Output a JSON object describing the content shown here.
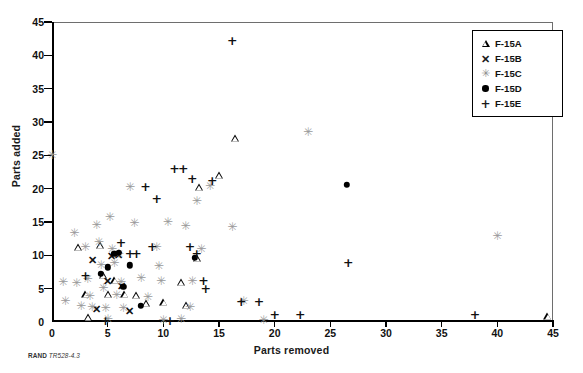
{
  "caption": {
    "bold": "RAND",
    "italic": "TR528-4.3"
  },
  "legend": {
    "position": "top-right",
    "entries": [
      {
        "label": "F-15A",
        "marker": "triangle"
      },
      {
        "label": "F-15B",
        "marker": "x"
      },
      {
        "label": "F-15C",
        "marker": "asterisk"
      },
      {
        "label": "F-15D",
        "marker": "filled-circle"
      },
      {
        "label": "F-15E",
        "marker": "plus"
      }
    ]
  },
  "chart_data": {
    "type": "scatter",
    "title": "",
    "xlabel": "Parts removed",
    "ylabel": "Parts added",
    "xlim": [
      0,
      45
    ],
    "ylim": [
      0,
      45
    ],
    "xticks": [
      0,
      5,
      10,
      15,
      20,
      25,
      30,
      35,
      40,
      45
    ],
    "yticks": [
      0,
      5,
      10,
      15,
      20,
      25,
      30,
      35,
      40,
      45
    ],
    "grid": false,
    "series": [
      {
        "name": "F-15A",
        "marker": "triangle",
        "color": "#000000",
        "points": [
          [
            2.3,
            11.3
          ],
          [
            3.0,
            4.2
          ],
          [
            3.2,
            0.8
          ],
          [
            4.3,
            11.6
          ],
          [
            4.6,
            7.1
          ],
          [
            5.0,
            4.2
          ],
          [
            5.6,
            6.3
          ],
          [
            6.5,
            4.2
          ],
          [
            7.5,
            4.1
          ],
          [
            8.4,
            2.9
          ],
          [
            10.0,
            3.0
          ],
          [
            11.6,
            6.0
          ],
          [
            12.0,
            2.6
          ],
          [
            13.0,
            9.6
          ],
          [
            13.2,
            20.2
          ],
          [
            15.0,
            22.0
          ],
          [
            16.4,
            27.6
          ],
          [
            44.5,
            0.9
          ]
        ]
      },
      {
        "name": "F-15B",
        "marker": "x",
        "color": "#111111",
        "points": [
          [
            3.6,
            9.3
          ],
          [
            4.0,
            2.0
          ],
          [
            5.0,
            6.2
          ],
          [
            5.3,
            9.9
          ],
          [
            6.0,
            10.1
          ],
          [
            6.2,
            5.4
          ],
          [
            7.0,
            1.6
          ]
        ]
      },
      {
        "name": "F-15C",
        "marker": "asterisk",
        "color": "#9a9a9a",
        "points": [
          [
            0.0,
            25.0
          ],
          [
            1.0,
            6.0
          ],
          [
            1.2,
            3.1
          ],
          [
            2.0,
            13.4
          ],
          [
            2.2,
            5.9
          ],
          [
            2.6,
            2.4
          ],
          [
            3.0,
            11.3
          ],
          [
            3.2,
            6.4
          ],
          [
            3.4,
            3.9
          ],
          [
            3.6,
            2.2
          ],
          [
            4.0,
            14.6
          ],
          [
            4.2,
            12.0
          ],
          [
            4.4,
            8.6
          ],
          [
            4.6,
            5.1
          ],
          [
            4.8,
            2.1
          ],
          [
            5.0,
            0.4
          ],
          [
            5.2,
            15.8
          ],
          [
            5.4,
            11.0
          ],
          [
            5.6,
            8.8
          ],
          [
            5.8,
            4.0
          ],
          [
            6.0,
            10.2
          ],
          [
            6.2,
            6.0
          ],
          [
            6.4,
            2.1
          ],
          [
            7.0,
            20.2
          ],
          [
            7.4,
            14.9
          ],
          [
            8.0,
            6.6
          ],
          [
            8.6,
            3.8
          ],
          [
            9.4,
            11.3
          ],
          [
            9.6,
            8.4
          ],
          [
            9.8,
            6.1
          ],
          [
            10.0,
            0.3
          ],
          [
            10.4,
            15.0
          ],
          [
            11.6,
            0.4
          ],
          [
            12.0,
            14.4
          ],
          [
            12.4,
            2.3
          ],
          [
            12.6,
            6.1
          ],
          [
            13.0,
            18.1
          ],
          [
            13.4,
            11.0
          ],
          [
            14.2,
            20.4
          ],
          [
            16.2,
            14.3
          ],
          [
            17.2,
            3.1
          ],
          [
            19.0,
            0.3
          ],
          [
            23.0,
            28.5
          ],
          [
            40.0,
            12.9
          ]
        ]
      },
      {
        "name": "F-15D",
        "marker": "filled-circle",
        "color": "#000000",
        "points": [
          [
            4.4,
            7.2
          ],
          [
            5.0,
            8.2
          ],
          [
            5.6,
            10.2
          ],
          [
            6.0,
            10.4
          ],
          [
            6.4,
            5.3
          ],
          [
            7.0,
            8.5
          ],
          [
            8.0,
            2.4
          ],
          [
            12.8,
            9.6
          ],
          [
            26.5,
            20.6
          ]
        ]
      },
      {
        "name": "F-15E",
        "marker": "plus",
        "color": "#111111",
        "points": [
          [
            3.0,
            6.9
          ],
          [
            4.8,
            0.2
          ],
          [
            6.2,
            11.8
          ],
          [
            7.0,
            10.2
          ],
          [
            7.6,
            10.2
          ],
          [
            8.4,
            20.2
          ],
          [
            9.0,
            11.2
          ],
          [
            9.4,
            18.4
          ],
          [
            10.6,
            0.2
          ],
          [
            11.0,
            22.9
          ],
          [
            11.8,
            23.0
          ],
          [
            12.4,
            11.3
          ],
          [
            12.6,
            21.4
          ],
          [
            13.0,
            10.2
          ],
          [
            13.6,
            6.2
          ],
          [
            13.8,
            5.0
          ],
          [
            14.4,
            21.2
          ],
          [
            16.2,
            42.2
          ],
          [
            17.0,
            3.0
          ],
          [
            18.6,
            3.0
          ],
          [
            20.0,
            1.0
          ],
          [
            22.3,
            1.0
          ],
          [
            26.6,
            8.8
          ],
          [
            38.0,
            1.0
          ]
        ]
      }
    ]
  }
}
